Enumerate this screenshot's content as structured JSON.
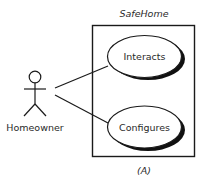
{
  "diagram": {
    "type": "uml-use-case",
    "system": {
      "title": "SafeHome"
    },
    "actor": {
      "name": "Homeowner"
    },
    "use_cases": [
      {
        "label": "Interacts"
      },
      {
        "label": "Configures"
      }
    ],
    "caption": "(A)",
    "colors": {
      "line": "#1a1a1a",
      "text": "#2a2a2a",
      "background": "#ffffff"
    }
  }
}
